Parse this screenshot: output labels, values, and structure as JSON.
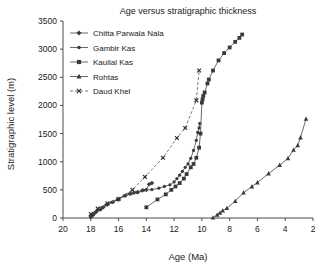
{
  "chart_data": {
    "type": "line",
    "title": "Age versus stratigraphic thickness",
    "xlabel": "Age (Ma)",
    "ylabel": "Stratigraphic level (m)",
    "xlim": [
      20,
      2
    ],
    "ylim": [
      0,
      3500
    ],
    "x_ticks": [
      20,
      18,
      16,
      14,
      12,
      10,
      8,
      6,
      4,
      2
    ],
    "y_ticks": [
      0,
      500,
      1000,
      1500,
      2000,
      2500,
      3000,
      3500
    ],
    "x_axis_reversed": true,
    "grid": false,
    "legend_position": "upper-left-inside",
    "series": [
      {
        "name": "Chitta Parwala Nala",
        "marker": "diamond",
        "line_style": "solid",
        "color": "#585858",
        "points": [
          [
            18.0,
            20
          ],
          [
            17.8,
            60
          ],
          [
            17.6,
            110
          ],
          [
            17.3,
            150
          ],
          [
            17.1,
            190
          ],
          [
            16.8,
            240
          ],
          [
            16.4,
            285
          ],
          [
            16.0,
            330
          ],
          [
            15.5,
            400
          ],
          [
            15.2,
            430
          ],
          [
            14.9,
            450
          ],
          [
            14.6,
            460
          ],
          [
            14.3,
            490
          ],
          [
            14.0,
            500
          ],
          [
            13.8,
            600
          ],
          [
            13.6,
            620
          ]
        ]
      },
      {
        "name": "Gambir Kas",
        "marker": "circle",
        "line_style": "solid",
        "color": "#585858",
        "points": [
          [
            18.0,
            15
          ],
          [
            17.9,
            55
          ],
          [
            17.7,
            100
          ],
          [
            17.5,
            140
          ],
          [
            17.2,
            185
          ],
          [
            16.9,
            235
          ],
          [
            16.5,
            280
          ],
          [
            16.1,
            325
          ],
          [
            15.6,
            395
          ],
          [
            15.1,
            430
          ],
          [
            14.7,
            455
          ],
          [
            14.2,
            495
          ],
          [
            13.6,
            505
          ],
          [
            13.1,
            530
          ],
          [
            12.7,
            560
          ],
          [
            12.3,
            590
          ],
          [
            12.0,
            640
          ],
          [
            11.8,
            700
          ],
          [
            11.6,
            760
          ],
          [
            11.4,
            830
          ],
          [
            11.2,
            900
          ],
          [
            11.0,
            960
          ],
          [
            10.8,
            1060
          ],
          [
            10.6,
            1200
          ],
          [
            10.4,
            1380
          ],
          [
            10.3,
            1520
          ],
          [
            10.2,
            1600
          ],
          [
            10.15,
            1680
          ]
        ]
      },
      {
        "name": "Kaulial Kas",
        "marker": "square",
        "line_style": "solid",
        "color": "#2a2a2a",
        "points": [
          [
            14.0,
            190
          ],
          [
            13.2,
            330
          ],
          [
            12.6,
            420
          ],
          [
            12.2,
            500
          ],
          [
            11.9,
            560
          ],
          [
            11.6,
            620
          ],
          [
            11.3,
            700
          ],
          [
            11.1,
            780
          ],
          [
            10.8,
            900
          ],
          [
            10.6,
            960
          ],
          [
            10.4,
            1070
          ],
          [
            10.2,
            1250
          ],
          [
            10.1,
            1500
          ],
          [
            10.0,
            2050
          ],
          [
            9.95,
            2110
          ],
          [
            9.9,
            2170
          ],
          [
            9.8,
            2230
          ],
          [
            9.6,
            2390
          ],
          [
            9.5,
            2460
          ],
          [
            9.2,
            2620
          ],
          [
            8.8,
            2800
          ],
          [
            8.4,
            2930
          ],
          [
            8.0,
            3030
          ],
          [
            7.6,
            3130
          ],
          [
            7.3,
            3200
          ],
          [
            7.1,
            3260
          ]
        ]
      },
      {
        "name": "Rohtas",
        "marker": "triangle",
        "line_style": "solid",
        "color": "#585858",
        "points": [
          [
            9.2,
            5
          ],
          [
            8.9,
            55
          ],
          [
            8.7,
            90
          ],
          [
            8.5,
            130
          ],
          [
            8.2,
            175
          ],
          [
            7.6,
            300
          ],
          [
            7.0,
            450
          ],
          [
            6.4,
            560
          ],
          [
            6.0,
            630
          ],
          [
            5.2,
            790
          ],
          [
            4.4,
            940
          ],
          [
            3.8,
            1060
          ],
          [
            3.4,
            1210
          ],
          [
            3.1,
            1290
          ],
          [
            2.9,
            1430
          ],
          [
            2.5,
            1760
          ]
        ]
      },
      {
        "name": "Daud Khel",
        "marker": "x",
        "line_style": "dashed",
        "color": "#6a6a6a",
        "points": [
          [
            18.0,
            70
          ],
          [
            17.5,
            170
          ],
          [
            16.8,
            260
          ],
          [
            16.0,
            340
          ],
          [
            15.0,
            500
          ],
          [
            14.1,
            730
          ],
          [
            12.8,
            1070
          ],
          [
            11.8,
            1420
          ],
          [
            11.2,
            1600
          ],
          [
            10.4,
            2090
          ],
          [
            10.2,
            2620
          ]
        ]
      }
    ]
  }
}
